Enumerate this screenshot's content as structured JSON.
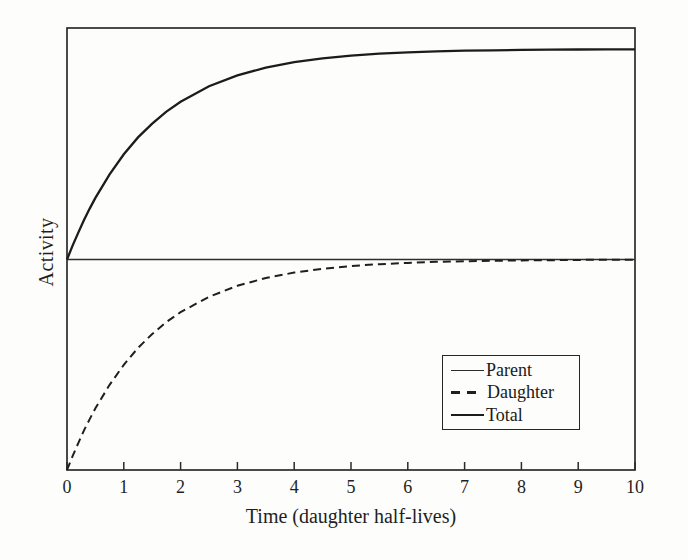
{
  "figure": {
    "background": "#fdfdfb",
    "line_color": "#1c1c1c",
    "border_color": "#2b2b2b"
  },
  "chart_data": {
    "type": "line",
    "title": "",
    "xlabel": "Time (daughter half-lives)",
    "ylabel": "Activity",
    "xlim": [
      0,
      10
    ],
    "ylim": [
      0,
      2.1
    ],
    "x_ticks": [
      0,
      1,
      2,
      3,
      4,
      5,
      6,
      7,
      8,
      9,
      10
    ],
    "y_ticks": [],
    "grid": false,
    "legend_position": "lower-right-inside",
    "x": [
      0,
      0.1,
      0.2,
      0.3,
      0.4,
      0.5,
      0.75,
      1,
      1.25,
      1.5,
      1.75,
      2,
      2.5,
      3,
      3.5,
      4,
      4.5,
      5,
      5.5,
      6,
      6.5,
      7,
      7.5,
      8,
      8.5,
      9,
      9.5,
      10
    ],
    "series": [
      {
        "name": "Parent",
        "style": "solid-thin",
        "values": [
          1,
          1,
          1,
          1,
          1,
          1,
          1,
          1,
          1,
          1,
          1,
          1,
          1,
          1,
          1,
          1,
          1,
          1,
          1,
          1,
          1,
          1,
          1,
          1,
          1,
          1,
          1,
          1
        ]
      },
      {
        "name": "Daughter",
        "style": "dashed",
        "values": [
          0,
          0.067,
          0.129,
          0.188,
          0.242,
          0.293,
          0.405,
          0.5,
          0.58,
          0.646,
          0.703,
          0.75,
          0.823,
          0.875,
          0.912,
          0.938,
          0.956,
          0.969,
          0.978,
          0.984,
          0.989,
          0.992,
          0.994,
          0.996,
          0.997,
          0.998,
          0.999,
          0.999
        ]
      },
      {
        "name": "Total",
        "style": "solid-thick",
        "values": [
          1,
          1.067,
          1.129,
          1.188,
          1.242,
          1.293,
          1.405,
          1.5,
          1.58,
          1.646,
          1.703,
          1.75,
          1.823,
          1.875,
          1.912,
          1.938,
          1.956,
          1.969,
          1.978,
          1.984,
          1.989,
          1.992,
          1.994,
          1.996,
          1.997,
          1.998,
          1.999,
          1.999
        ]
      }
    ]
  }
}
